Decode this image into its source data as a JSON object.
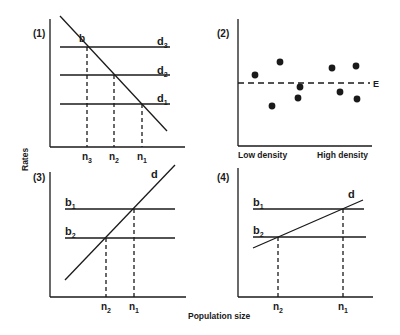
{
  "figure": {
    "y_axis_label": "Rates",
    "x_axis_label": "Population size",
    "ink_color": "#1a1a1a",
    "background": "#ffffff"
  },
  "panels": [
    {
      "id": "1",
      "label": "(1)",
      "curve_label": "b",
      "lines": [
        {
          "name": "d",
          "sub": "3"
        },
        {
          "name": "d",
          "sub": "2"
        },
        {
          "name": "d",
          "sub": "1"
        }
      ],
      "ticks": [
        {
          "name": "n",
          "sub": "3"
        },
        {
          "name": "n",
          "sub": "2"
        },
        {
          "name": "n",
          "sub": "1"
        }
      ]
    },
    {
      "id": "2",
      "label": "(2)",
      "equilibrium_label": "E",
      "x_left_label": "Low density",
      "x_right_label": "High density",
      "points": [
        {
          "x": 255,
          "y": 75
        },
        {
          "x": 280,
          "y": 62
        },
        {
          "x": 272,
          "y": 106
        },
        {
          "x": 298,
          "y": 98
        },
        {
          "x": 300,
          "y": 87
        },
        {
          "x": 332,
          "y": 68
        },
        {
          "x": 340,
          "y": 92
        },
        {
          "x": 356,
          "y": 66
        },
        {
          "x": 357,
          "y": 99
        }
      ]
    },
    {
      "id": "3",
      "label": "(3)",
      "curve_label": "d",
      "lines": [
        {
          "name": "b",
          "sub": "1"
        },
        {
          "name": "b",
          "sub": "2"
        }
      ],
      "ticks": [
        {
          "name": "n",
          "sub": "2"
        },
        {
          "name": "n",
          "sub": "1"
        }
      ]
    },
    {
      "id": "4",
      "label": "(4)",
      "curve_label": "d",
      "lines": [
        {
          "name": "b",
          "sub": "1"
        },
        {
          "name": "b",
          "sub": "2"
        }
      ],
      "ticks": [
        {
          "name": "n",
          "sub": "2"
        },
        {
          "name": "n",
          "sub": "1"
        }
      ]
    }
  ]
}
